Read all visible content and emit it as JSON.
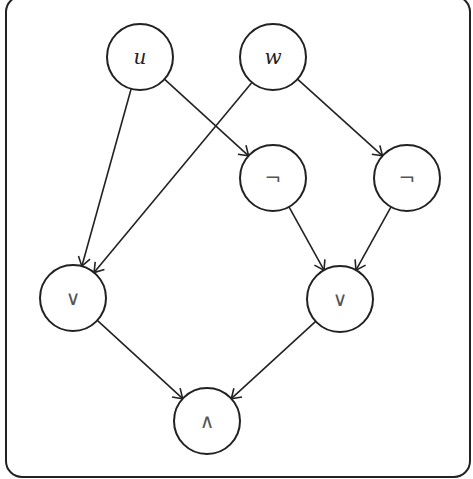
{
  "diagram": {
    "type": "boolean-circuit",
    "frame": {
      "x": 6,
      "y": -4,
      "width": 464,
      "height": 481,
      "radius": 16
    },
    "colors": {
      "stroke": "#222222",
      "background": "#ffffff",
      "op_text": "#555555"
    },
    "nodes": [
      {
        "id": "u",
        "label": "u",
        "kind": "variable",
        "cx": 140,
        "cy": 57,
        "r": 33
      },
      {
        "id": "w",
        "label": "w",
        "kind": "variable",
        "cx": 273,
        "cy": 57,
        "r": 33
      },
      {
        "id": "not1",
        "label": "¬",
        "kind": "operator",
        "cx": 273,
        "cy": 178,
        "r": 33
      },
      {
        "id": "not2",
        "label": "¬",
        "kind": "operator",
        "cx": 407,
        "cy": 178,
        "r": 33
      },
      {
        "id": "or1",
        "label": "∨",
        "kind": "operator",
        "cx": 73,
        "cy": 298,
        "r": 33
      },
      {
        "id": "or2",
        "label": "∨",
        "kind": "operator",
        "cx": 340,
        "cy": 299,
        "r": 33
      },
      {
        "id": "and1",
        "label": "∧",
        "kind": "operator",
        "cx": 207,
        "cy": 421,
        "r": 33
      }
    ],
    "edges": [
      {
        "from": "u",
        "to": "or1"
      },
      {
        "from": "u",
        "to": "not1"
      },
      {
        "from": "w",
        "to": "or1"
      },
      {
        "from": "w",
        "to": "not2"
      },
      {
        "from": "not1",
        "to": "or2"
      },
      {
        "from": "not2",
        "to": "or2"
      },
      {
        "from": "or1",
        "to": "and1"
      },
      {
        "from": "or2",
        "to": "and1"
      }
    ]
  }
}
